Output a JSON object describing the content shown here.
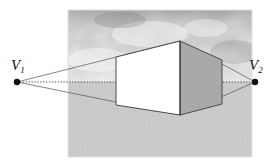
{
  "figure": {
    "type": "two-point-perspective-diagram",
    "title": "",
    "background_color": "#ffffff"
  },
  "picture_frame": {
    "name": "picture-plane",
    "x": 68,
    "y": 10,
    "width": 184,
    "height": 147,
    "border_color": "#ffffff",
    "sky": {
      "label": "cloudy-sky",
      "base_color": "#b9b9b9",
      "highlight_color": "#f2f2f2",
      "shadow_color": "#8f8f8f",
      "region": {
        "x": 68,
        "y": 10,
        "width": 184,
        "height": 72
      }
    },
    "ground": {
      "label": "ground-plane",
      "color": "#c2c2c2",
      "region": {
        "x": 68,
        "y": 82,
        "width": 184,
        "height": 75
      }
    }
  },
  "horizon": {
    "label": "horizon-line",
    "y": 82,
    "x_start": 17,
    "x_end": 255,
    "style": "dotted",
    "color": "#3a3a3a"
  },
  "vanishing_points": [
    {
      "id": "v1",
      "label": "V",
      "subscript": "1",
      "x": 17,
      "y": 82,
      "dot_radius": 3.2,
      "dot_color": "#111111",
      "label_x": 11,
      "label_y": 58
    },
    {
      "id": "v2",
      "label": "V",
      "subscript": "2",
      "x": 255,
      "y": 82,
      "dot_radius": 3.2,
      "dot_color": "#111111",
      "label_x": 249,
      "label_y": 58
    }
  ],
  "box": {
    "label": "perspective-box",
    "front_edge_x": 180,
    "front_edge_top_y": 41,
    "front_edge_bottom_y": 115,
    "left_back_edge_x": 116,
    "left_back_top_y": 57,
    "left_back_bottom_y": 105,
    "right_back_edge_x": 222,
    "right_back_top_y": 60,
    "right_back_bottom_y": 104,
    "left_face": {
      "name": "left-face",
      "fill": "#ffffff",
      "points": "116,57 180,41 180,115 116,105"
    },
    "right_face": {
      "name": "right-face",
      "fill": "#a9a9a9",
      "points": "180,41 222,60 222,104 180,115"
    },
    "edge_color": "#4a4a4a",
    "edge_width": 1
  },
  "construction_lines": {
    "label": "perspective-construction-lines",
    "color": "#555555",
    "width": 0.7,
    "lines": [
      {
        "name": "v1-to-box-top-left",
        "x1": 17,
        "y1": 82,
        "x2": 180,
        "y2": 41
      },
      {
        "name": "v1-to-box-bottom-left",
        "x1": 17,
        "y1": 82,
        "x2": 180,
        "y2": 115
      },
      {
        "name": "v2-to-box-top-right",
        "x1": 255,
        "y1": 82,
        "x2": 180,
        "y2": 41
      },
      {
        "name": "v2-to-box-bottom-right",
        "x1": 255,
        "y1": 82,
        "x2": 180,
        "y2": 115
      }
    ]
  }
}
